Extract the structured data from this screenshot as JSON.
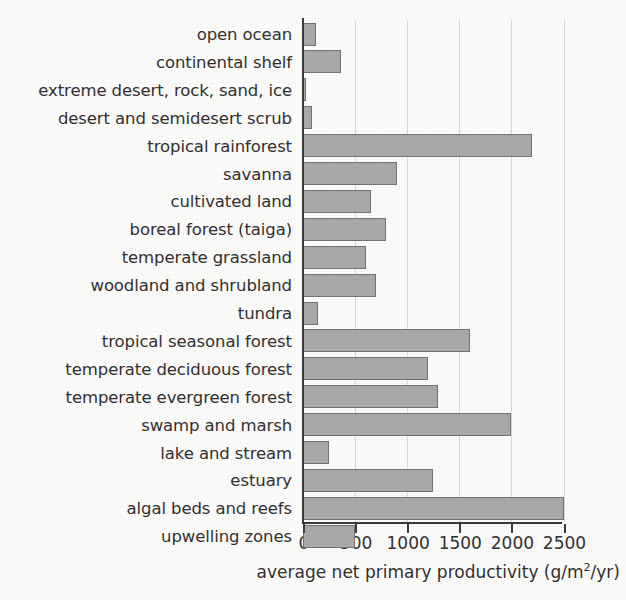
{
  "chart_data": {
    "type": "bar",
    "orientation": "horizontal",
    "title": "",
    "xlabel": "average net primary productivity (g/m2/yr)",
    "xlabel_parts": {
      "pre": "average net primary productivity (g/m",
      "sup": "2",
      "post": "/yr)"
    },
    "ylabel": "",
    "xlim": [
      0,
      2700
    ],
    "xticks": [
      0,
      500,
      1000,
      1500,
      2000,
      2500
    ],
    "xtick_labels": [
      "0",
      "500",
      "1000",
      "1500",
      "2000",
      "2500"
    ],
    "grid": "vertical",
    "legend": "none",
    "categories": [
      "open ocean",
      "continental shelf",
      "extreme desert, rock, sand, ice",
      "desert and semidesert scrub",
      "tropical rainforest",
      "savanna",
      "cultivated land",
      "boreal forest (taiga)",
      "temperate grassland",
      "woodland and shrubland",
      "tundra",
      "tropical seasonal forest",
      "temperate deciduous forest",
      "temperate evergreen forest",
      "swamp and marsh",
      "lake and stream",
      "estuary",
      "algal beds and reefs",
      "upwelling zones"
    ],
    "values": [
      125,
      360,
      30,
      90,
      2200,
      900,
      650,
      800,
      600,
      700,
      140,
      1600,
      1200,
      1300,
      2000,
      250,
      1250,
      2500,
      500
    ],
    "colors": {
      "bar_fill": "#a9a9a7",
      "bar_border": "#737371",
      "axis": "#3a3a3a",
      "gridline": "#d8d8d6",
      "text": "#32302f",
      "background": "#fbfbfa"
    }
  }
}
